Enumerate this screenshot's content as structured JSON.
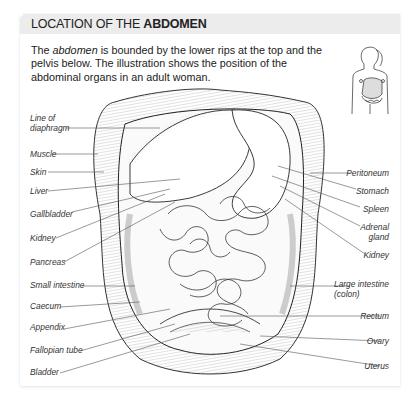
{
  "header": {
    "title_prefix": "LOCATION OF THE ",
    "title_bold": "ABDOMEN"
  },
  "description": {
    "part1": "The ",
    "italic": "abdomen",
    "part2": " is bounded by the lower rips at the top and the pelvis below. The illustration shows the position of the abdominal organs in an adult woman."
  },
  "thumbnail": {
    "icon": "female-torso-outline-icon"
  },
  "labels_left": [
    {
      "id": "line-of-diaphragm",
      "line1": "Line of",
      "line2": "diaphragm"
    },
    {
      "id": "muscle",
      "line1": "Muscle"
    },
    {
      "id": "skin",
      "line1": "Skin"
    },
    {
      "id": "liver",
      "line1": "Liver"
    },
    {
      "id": "gallbladder",
      "line1": "Gallbladder"
    },
    {
      "id": "kidney",
      "line1": "Kidney"
    },
    {
      "id": "pancreas",
      "line1": "Pancreas"
    },
    {
      "id": "small-intestine",
      "line1": "Small intestine"
    },
    {
      "id": "caecum",
      "line1": "Caecum"
    },
    {
      "id": "appendix",
      "line1": "Appendix"
    },
    {
      "id": "fallopian-tube",
      "line1": "Fallopian tube"
    },
    {
      "id": "bladder",
      "line1": "Bladder"
    }
  ],
  "labels_right": [
    {
      "id": "peritoneum",
      "line1": "Peritoneum"
    },
    {
      "id": "stomach",
      "line1": "Stomach"
    },
    {
      "id": "spleen",
      "line1": "Spleen"
    },
    {
      "id": "adrenal-gland",
      "line1": "Adrenal",
      "line2": "gland"
    },
    {
      "id": "kidney-right",
      "line1": "Kidney"
    },
    {
      "id": "large-intestine",
      "line1": "Large intestine",
      "line2": "(colon)"
    },
    {
      "id": "rectum",
      "line1": "Rectum"
    },
    {
      "id": "ovary",
      "line1": "Ovary"
    },
    {
      "id": "uterus",
      "line1": "Uterus"
    }
  ]
}
